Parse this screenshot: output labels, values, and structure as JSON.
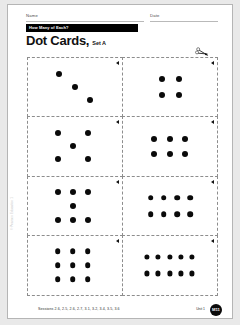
{
  "header": {
    "name_label": "Name",
    "date_label": "Date",
    "banner_text": "How Many of Each?"
  },
  "title": {
    "main": "Dot Cards,",
    "sub": "Set A"
  },
  "icons": {
    "cut_marker": "scissors-icon",
    "card_corner": "triangle-marker-icon"
  },
  "cards": [
    {
      "id": "card-1",
      "count": 3,
      "arrangement": "diagonal",
      "dots": [
        {
          "x": 33,
          "y": 28
        },
        {
          "x": 50,
          "y": 50
        },
        {
          "x": 66,
          "y": 72
        }
      ]
    },
    {
      "id": "card-2",
      "count": 4,
      "arrangement": "square",
      "dots": [
        {
          "x": 42,
          "y": 36
        },
        {
          "x": 60,
          "y": 36
        },
        {
          "x": 42,
          "y": 64
        },
        {
          "x": 60,
          "y": 64
        }
      ]
    },
    {
      "id": "card-3",
      "count": 5,
      "arrangement": "dice-five",
      "dots": [
        {
          "x": 32,
          "y": 28
        },
        {
          "x": 64,
          "y": 28
        },
        {
          "x": 48,
          "y": 50
        },
        {
          "x": 32,
          "y": 72
        },
        {
          "x": 64,
          "y": 72
        }
      ]
    },
    {
      "id": "card-4",
      "count": 6,
      "arrangement": "two-rows-of-three",
      "dots": [
        {
          "x": 34,
          "y": 38
        },
        {
          "x": 50,
          "y": 38
        },
        {
          "x": 66,
          "y": 38
        },
        {
          "x": 34,
          "y": 64
        },
        {
          "x": 50,
          "y": 64
        },
        {
          "x": 66,
          "y": 64
        }
      ]
    },
    {
      "id": "card-5",
      "count": 7,
      "arrangement": "three-one-three",
      "dots": [
        {
          "x": 32,
          "y": 26
        },
        {
          "x": 48,
          "y": 26
        },
        {
          "x": 64,
          "y": 26
        },
        {
          "x": 48,
          "y": 50
        },
        {
          "x": 32,
          "y": 74
        },
        {
          "x": 48,
          "y": 74
        },
        {
          "x": 64,
          "y": 74
        }
      ]
    },
    {
      "id": "card-6",
      "count": 8,
      "arrangement": "two-rows-of-four",
      "dots": [
        {
          "x": 30,
          "y": 36
        },
        {
          "x": 44,
          "y": 36
        },
        {
          "x": 58,
          "y": 36
        },
        {
          "x": 72,
          "y": 36
        },
        {
          "x": 30,
          "y": 64
        },
        {
          "x": 44,
          "y": 64
        },
        {
          "x": 58,
          "y": 64
        },
        {
          "x": 72,
          "y": 64
        }
      ]
    },
    {
      "id": "card-7",
      "count": 9,
      "arrangement": "three-by-three",
      "dots": [
        {
          "x": 32,
          "y": 26
        },
        {
          "x": 48,
          "y": 26
        },
        {
          "x": 64,
          "y": 26
        },
        {
          "x": 32,
          "y": 50
        },
        {
          "x": 48,
          "y": 50
        },
        {
          "x": 64,
          "y": 50
        },
        {
          "x": 32,
          "y": 74
        },
        {
          "x": 48,
          "y": 74
        },
        {
          "x": 64,
          "y": 74
        }
      ]
    },
    {
      "id": "card-8",
      "count": 10,
      "arrangement": "two-rows-of-five",
      "dots": [
        {
          "x": 26,
          "y": 36
        },
        {
          "x": 38,
          "y": 36
        },
        {
          "x": 50,
          "y": 36
        },
        {
          "x": 62,
          "y": 36
        },
        {
          "x": 74,
          "y": 36
        },
        {
          "x": 26,
          "y": 64
        },
        {
          "x": 38,
          "y": 64
        },
        {
          "x": 50,
          "y": 64
        },
        {
          "x": 62,
          "y": 64
        },
        {
          "x": 74,
          "y": 64
        }
      ]
    }
  ],
  "footer": {
    "sessions": "Sessions 2.6, 2.5, 2.6, 2.7, 3.1, 3.2, 3.4, 3.5, 3.6",
    "unit": "Unit 1",
    "badge": "M11"
  },
  "side_copyright": "© Pearson Education 1"
}
